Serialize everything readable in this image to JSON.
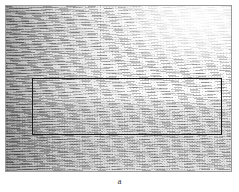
{
  "figure": {
    "kind": "seismic-section",
    "caption": "a",
    "panel": {
      "border_color": "#9a9a9a",
      "background_color": "#fdfdfd",
      "left": 5,
      "top": 5,
      "width": 227,
      "height": 167
    },
    "highlight_box": {
      "label": "",
      "border_color": "#1a1a1a",
      "left": 26,
      "top": 72,
      "width": 190,
      "height": 57
    },
    "marker_line": {
      "label": "",
      "color": "#5a5a5a",
      "x": 94,
      "style": "dotted-vertical"
    },
    "texture_zones": [
      {
        "name": "upper-left-dense-reflections",
        "tone": "dark"
      },
      {
        "name": "upper-right-curved-reflections",
        "tone": "light"
      },
      {
        "name": "mid-banded-reflections",
        "tone": "medium"
      },
      {
        "name": "lower-speckled-noise",
        "tone": "medium"
      }
    ]
  }
}
